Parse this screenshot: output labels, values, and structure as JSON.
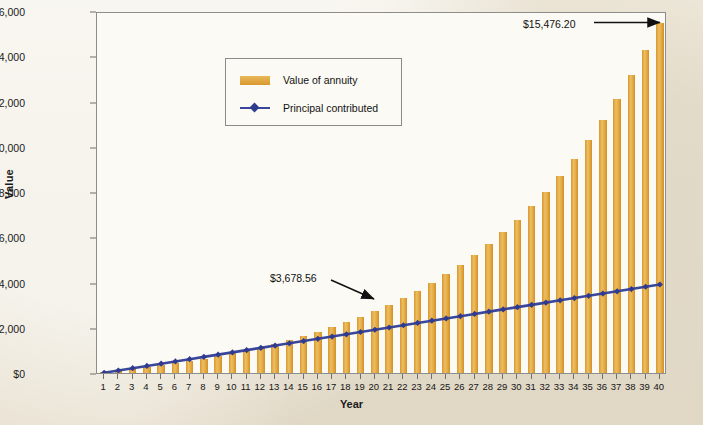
{
  "chart_data": {
    "type": "bar",
    "title": "",
    "xlabel": "Year",
    "ylabel": "Value",
    "xlim": [
      0.5,
      40.5
    ],
    "ylim": [
      0,
      16000
    ],
    "grid": false,
    "legend_position": "top-left inside plot",
    "y_ticks": [
      "$0",
      "$2,000",
      "$4,000",
      "$6,000",
      "$8,000",
      "$10,000",
      "$12,000",
      "$14,000",
      "$16,000"
    ],
    "y_tick_values": [
      0,
      2000,
      4000,
      6000,
      8000,
      10000,
      12000,
      14000,
      16000
    ],
    "categories": [
      1,
      2,
      3,
      4,
      5,
      6,
      7,
      8,
      9,
      10,
      11,
      12,
      13,
      14,
      15,
      16,
      17,
      18,
      19,
      20,
      21,
      22,
      23,
      24,
      25,
      26,
      27,
      28,
      29,
      30,
      31,
      32,
      33,
      34,
      35,
      36,
      37,
      38,
      39,
      40
    ],
    "series": [
      {
        "name": "Value of annuity",
        "type": "bar",
        "color": "#e0a63c",
        "values": [
          100.0,
          208.0,
          324.64,
          450.61,
          586.66,
          733.59,
          892.28,
          1063.66,
          1248.76,
          1448.66,
          1664.55,
          1897.71,
          2149.53,
          2421.49,
          2715.21,
          3032.42,
          3375.01,
          3745.01,
          4144.61,
          4576.2,
          5042.29,
          5545.68,
          6089.33,
          6676.48,
          7310.6,
          7995.44,
          8735.08,
          9533.89,
          10396.6,
          11328.33,
          12334.6,
          13421.37,
          14595.08,
          15862.68,
          17231.7,
          18710.23,
          20307.05,
          22031.61,
          23894.14,
          25905.67
        ]
      },
      {
        "name": "Principal contributed",
        "type": "line",
        "color": "#39469b",
        "marker": "diamond",
        "values": [
          100,
          200,
          300,
          400,
          500,
          600,
          700,
          800,
          900,
          1000,
          1100,
          1200,
          1300,
          1400,
          1500,
          1600,
          1700,
          1800,
          1900,
          2000,
          2100,
          2200,
          2300,
          2400,
          2500,
          2600,
          2700,
          2800,
          2900,
          3000,
          3100,
          3200,
          3300,
          3400,
          3500,
          3600,
          3700,
          3800,
          3900,
          4000
        ]
      }
    ],
    "annotations": [
      {
        "name": "final-value",
        "text": "$15,476.20",
        "points_to_year": 40
      },
      {
        "name": "midpoint-value",
        "text": "$3,678.56",
        "points_to_year": 20
      }
    ]
  },
  "axes": {
    "y_title": "Value",
    "x_title": "Year"
  },
  "legend": {
    "annuity_label": "Value of annuity",
    "principal_label": "Principal contributed"
  },
  "annotations": {
    "final_value": "$15,476.20",
    "mid_value": "$3,678.56"
  },
  "colors": {
    "bar": "#e0a63c",
    "line": "#39469b",
    "plot_background": "#fbfaf4",
    "page_background": "#ede7d9",
    "axis": "#6f6f6f"
  }
}
